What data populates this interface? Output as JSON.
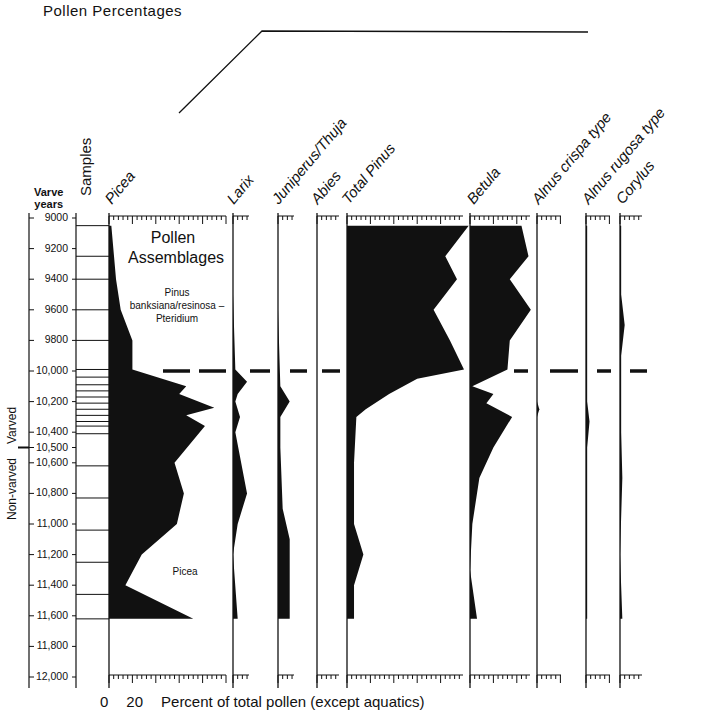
{
  "title": "Pollen  Percentages",
  "axis": {
    "y_header_line1": "Varve",
    "y_header_line2": "years",
    "samples_label": "Samples",
    "x_zero": "0",
    "x_twenty": "20",
    "x_label": "Percent of total pollen (except  aquatics)",
    "varved_label": "Varved",
    "nonvarved_label": "Non-varved"
  },
  "y_ticks": [
    "9000",
    "9200",
    "9400",
    "9600",
    "9800",
    "10,000",
    "10,200",
    "10,400",
    "10,500",
    "10,600",
    "10,800",
    "11,000",
    "11,200",
    "11,400",
    "11,600",
    "11,800",
    "12,000"
  ],
  "assemblages": {
    "heading_line1": "Pollen",
    "heading_line2": "Assemblages",
    "upper_zone_line1": "Pinus",
    "upper_zone_line2": "banksiana/resinosa –",
    "upper_zone_line3": "Pteridium",
    "lower_zone": "Picea"
  },
  "taxa": [
    "Picea",
    "Larix",
    "Juniperus/Thuja",
    "Abies",
    "Total Pinus",
    "Betula",
    "Alnus crispa type",
    "Alnus rugosa type",
    "Corylus"
  ],
  "chart_data": {
    "type": "area",
    "title": "Pollen Percentages",
    "xlabel": "Percent of total pollen (except aquatics)",
    "ylabel": "Varve years",
    "y_range": [
      9000,
      12000
    ],
    "y_ticks": [
      9000,
      9200,
      9400,
      9600,
      9800,
      10000,
      10200,
      10400,
      10500,
      10600,
      10800,
      11000,
      11200,
      11400,
      11600,
      11800,
      12000
    ],
    "zone_boundary_years": 10000,
    "zones": [
      {
        "name": "Pinus banksiana/resinosa – Pteridium",
        "from": 9050,
        "to": 10000
      },
      {
        "name": "Picea",
        "from": 10000,
        "to": 11620
      }
    ],
    "sample_depths": [
      9050,
      9250,
      9400,
      9600,
      9800,
      9990,
      10040,
      10090,
      10130,
      10170,
      10210,
      10250,
      10290,
      10330,
      10360,
      10410,
      10620,
      10830,
      11040,
      11250,
      11460,
      11620
    ],
    "series": [
      {
        "name": "Picea",
        "scale_max": 50,
        "points": [
          [
            9050,
            1
          ],
          [
            9400,
            3
          ],
          [
            9600,
            5
          ],
          [
            9800,
            10
          ],
          [
            9990,
            10
          ],
          [
            10100,
            33
          ],
          [
            10150,
            30
          ],
          [
            10240,
            45
          ],
          [
            10290,
            33
          ],
          [
            10360,
            41
          ],
          [
            10600,
            28
          ],
          [
            10800,
            32
          ],
          [
            11000,
            29
          ],
          [
            11200,
            14
          ],
          [
            11400,
            7
          ],
          [
            11620,
            36
          ]
        ]
      },
      {
        "name": "Larix",
        "scale_max": 10,
        "points": [
          [
            9500,
            0
          ],
          [
            9990,
            1
          ],
          [
            10070,
            6
          ],
          [
            10150,
            2
          ],
          [
            10200,
            1
          ],
          [
            10300,
            3
          ],
          [
            10400,
            1
          ],
          [
            10800,
            6
          ],
          [
            11000,
            2
          ],
          [
            11200,
            0
          ],
          [
            11620,
            2
          ]
        ]
      },
      {
        "name": "Juniperus/Thuja",
        "scale_max": 10,
        "points": [
          [
            9600,
            0
          ],
          [
            10100,
            1
          ],
          [
            10200,
            5
          ],
          [
            10300,
            1
          ],
          [
            10500,
            1
          ],
          [
            10900,
            2
          ],
          [
            11100,
            5
          ],
          [
            11620,
            5
          ]
        ]
      },
      {
        "name": "Abies",
        "scale_max": 10,
        "points": []
      },
      {
        "name": "Total Pinus",
        "scale_max": 50,
        "points": [
          [
            9050,
            52
          ],
          [
            9250,
            42
          ],
          [
            9400,
            47
          ],
          [
            9600,
            37
          ],
          [
            9800,
            44
          ],
          [
            9990,
            50
          ],
          [
            10050,
            30
          ],
          [
            10150,
            18
          ],
          [
            10250,
            8
          ],
          [
            10300,
            4
          ],
          [
            10600,
            3
          ],
          [
            11000,
            3
          ],
          [
            11200,
            7
          ],
          [
            11400,
            3
          ],
          [
            11620,
            3
          ]
        ]
      },
      {
        "name": "Betula",
        "scale_max": 30,
        "points": [
          [
            9050,
            22
          ],
          [
            9250,
            25
          ],
          [
            9400,
            17
          ],
          [
            9600,
            26
          ],
          [
            9800,
            17
          ],
          [
            9990,
            16
          ],
          [
            10100,
            1
          ],
          [
            10150,
            10
          ],
          [
            10210,
            7
          ],
          [
            10300,
            18
          ],
          [
            10500,
            10
          ],
          [
            10700,
            4
          ],
          [
            11000,
            1
          ],
          [
            11300,
            0
          ],
          [
            11620,
            3
          ]
        ]
      },
      {
        "name": "Alnus crispa type",
        "scale_max": 10,
        "points": [
          [
            10200,
            0
          ],
          [
            10250,
            1
          ],
          [
            10300,
            0
          ]
        ]
      },
      {
        "name": "Alnus rugosa type",
        "scale_max": 10,
        "points": [
          [
            9050,
            0.5
          ],
          [
            9800,
            0.5
          ],
          [
            10200,
            0.5
          ],
          [
            10330,
            1.5
          ],
          [
            10500,
            0.5
          ],
          [
            11620,
            0.5
          ]
        ]
      },
      {
        "name": "Corylus",
        "scale_max": 10,
        "points": [
          [
            9050,
            0.5
          ],
          [
            9500,
            0.5
          ],
          [
            9700,
            2
          ],
          [
            9900,
            0.5
          ],
          [
            10400,
            0.5
          ],
          [
            10700,
            1
          ],
          [
            11200,
            0
          ],
          [
            11620,
            1
          ]
        ]
      }
    ]
  }
}
